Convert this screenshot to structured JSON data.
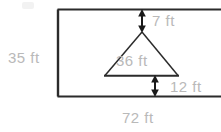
{
  "figure": {
    "units": "ft",
    "colors": {
      "outline": "#2b2b2b",
      "label_text": "#b9b9b9",
      "background": "#ffffff"
    },
    "labels": {
      "height": "35 ft",
      "width": "72 ft",
      "top_gap": "7 ft",
      "bottom_gap": "12 ft",
      "triangle_base": "36 ft"
    },
    "shapes": {
      "rectangle": {
        "name": "outer-rectangle",
        "height_label": "35 ft",
        "width_label": "72 ft"
      },
      "triangle": {
        "name": "inner-triangle",
        "base_label": "36 ft"
      }
    },
    "annotations": [
      {
        "name": "top-gap-arrow",
        "label": "7 ft",
        "direction": "vertical-double"
      },
      {
        "name": "bottom-gap-arrow",
        "label": "12 ft",
        "direction": "vertical-double"
      }
    ]
  }
}
